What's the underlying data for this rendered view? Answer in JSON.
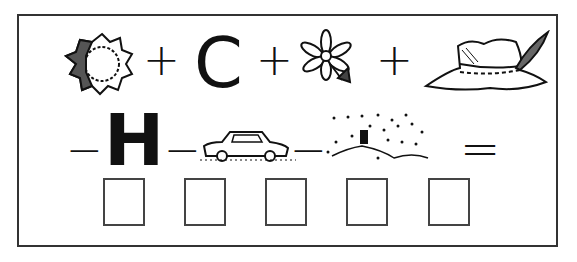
{
  "puzzle": {
    "type": "rebus",
    "row1": [
      {
        "kind": "picture",
        "name": "sun"
      },
      {
        "kind": "operator",
        "value": "+"
      },
      {
        "kind": "letter",
        "value": "C"
      },
      {
        "kind": "operator",
        "value": "+"
      },
      {
        "kind": "picture",
        "name": "flower"
      },
      {
        "kind": "operator",
        "value": "+"
      },
      {
        "kind": "picture",
        "name": "hat"
      }
    ],
    "row2": [
      {
        "kind": "operator",
        "value": "−"
      },
      {
        "kind": "letter",
        "value": "H"
      },
      {
        "kind": "operator",
        "value": "−"
      },
      {
        "kind": "picture",
        "name": "car"
      },
      {
        "kind": "operator",
        "value": "−"
      },
      {
        "kind": "picture",
        "name": "snow"
      },
      {
        "kind": "operator",
        "value": "="
      }
    ],
    "answer_boxes": [
      "",
      "",
      "",
      "",
      ""
    ]
  }
}
